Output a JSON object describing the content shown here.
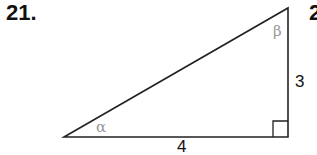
{
  "problem": {
    "number": "21.",
    "next_number_partial": "2"
  },
  "triangle": {
    "side_vertical": "3",
    "side_horizontal": "4",
    "angle_left": "α",
    "angle_top": "β",
    "right_angle": "bottom-right"
  }
}
